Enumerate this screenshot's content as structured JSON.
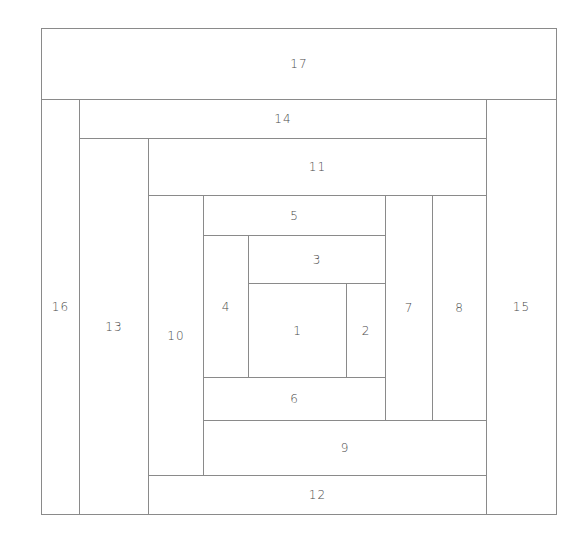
{
  "diagram": {
    "title": "",
    "line_color": "#8a8a8a",
    "pieces": [
      {
        "label": "17",
        "x": 41,
        "y": 28,
        "w": 516,
        "h": 72
      },
      {
        "label": "16",
        "x": 41,
        "y": 99,
        "w": 39,
        "h": 416
      },
      {
        "label": "14",
        "x": 79,
        "y": 99,
        "w": 408,
        "h": 40
      },
      {
        "label": "15",
        "x": 486,
        "y": 99,
        "w": 71,
        "h": 416
      },
      {
        "label": "13",
        "x": 79,
        "y": 138,
        "w": 70,
        "h": 377
      },
      {
        "label": "11",
        "x": 148,
        "y": 138,
        "w": 339,
        "h": 58
      },
      {
        "label": "12",
        "x": 148,
        "y": 475,
        "w": 339,
        "h": 40
      },
      {
        "label": "10",
        "x": 148,
        "y": 195,
        "w": 56,
        "h": 281
      },
      {
        "label": "9",
        "x": 203,
        "y": 420,
        "w": 284,
        "h": 56
      },
      {
        "label": "8",
        "x": 432,
        "y": 195,
        "w": 55,
        "h": 226
      },
      {
        "label": "7",
        "x": 385,
        "y": 195,
        "w": 48,
        "h": 226
      },
      {
        "label": "5",
        "x": 203,
        "y": 195,
        "w": 183,
        "h": 41
      },
      {
        "label": "6",
        "x": 203,
        "y": 377,
        "w": 183,
        "h": 44
      },
      {
        "label": "4",
        "x": 203,
        "y": 235,
        "w": 46,
        "h": 143
      },
      {
        "label": "3",
        "x": 248,
        "y": 235,
        "w": 138,
        "h": 49
      },
      {
        "label": "2",
        "x": 346,
        "y": 283,
        "w": 40,
        "h": 95
      },
      {
        "label": "1",
        "x": 248,
        "y": 283,
        "w": 99,
        "h": 95
      }
    ]
  }
}
